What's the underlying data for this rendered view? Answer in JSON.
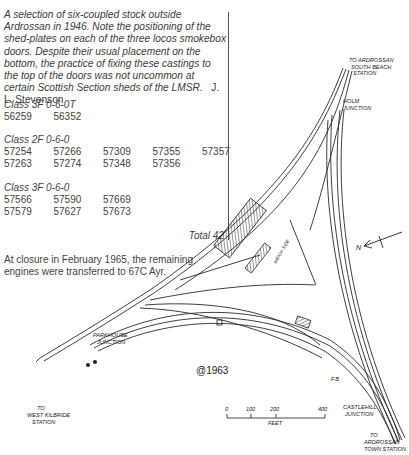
{
  "caption": {
    "text": "A selection of six-coupled stock outside Ardrossan in 1946. Note the positioning of the shed-plates on each of the three locos smokebox doors. Despite their usual placement on the bottom, the practice of fixing these castings to the top of the doors was not uncommon at certain Scottish Section sheds of the LMSR.",
    "credit": "J. L. Stevenson"
  },
  "allocation": {
    "classes": [
      {
        "label": "Class 3F 0-6-0T",
        "rows": [
          [
            "56259",
            "56352"
          ]
        ]
      },
      {
        "label": "Class 2F 0-6-0",
        "rows": [
          [
            "57254",
            "57266",
            "57309",
            "57355",
            "57357"
          ],
          [
            "57263",
            "57274",
            "57348",
            "57356"
          ]
        ]
      },
      {
        "label": "Class 3F 0-6-0",
        "rows": [
          [
            "57566",
            "57590",
            "57669"
          ],
          [
            "57579",
            "57627",
            "57673"
          ]
        ]
      }
    ],
    "total": "Total 42",
    "closure_note": "At closure in February 1965, the remaining engines were transferred to 67C Ayr."
  },
  "diagram": {
    "labels": {
      "south_beach": [
        "TO ARDROSSAN",
        "SOUTH BEACH",
        "STATION"
      ],
      "holm_junction": [
        "HOLM",
        "JUNCTION"
      ],
      "parkhouse_junction": [
        "PARKHOUSE",
        "JUNCTION"
      ],
      "west_kilbride": [
        "TO",
        "WEST KILBRIDE",
        "STATION"
      ],
      "castlehill_junction": [
        "CASTLEHILL",
        "JUNCTION"
      ],
      "town_station": [
        "TO",
        "ARDROSSAN",
        "TOWN STATION"
      ],
      "fb": "F.B.",
      "year": "@1963",
      "north": "N",
      "shed_label": "WEIGH SIDE"
    },
    "scale": {
      "ticks": [
        "0",
        "100",
        "200",
        "400"
      ],
      "unit": "FEET"
    }
  }
}
